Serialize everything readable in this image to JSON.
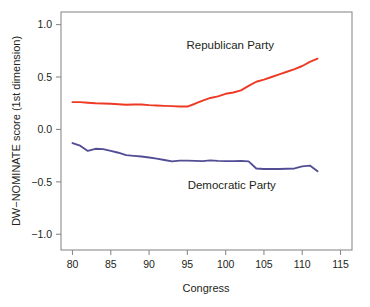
{
  "chart_data": {
    "type": "line",
    "title": "",
    "xlabel": "Congress",
    "ylabel": "DW−NOMINATE score (1st dimension)",
    "xlim": [
      78.5,
      116.5
    ],
    "ylim": [
      -1.15,
      1.12
    ],
    "xticks": [
      80,
      85,
      90,
      95,
      100,
      105,
      110,
      115
    ],
    "xticklabels": [
      "80",
      "85",
      "90",
      "95",
      "100",
      "105",
      "110",
      "115"
    ],
    "yticks": [
      1.0,
      0.5,
      0.0,
      -0.5,
      -1.0
    ],
    "yticklabels": [
      "1.0",
      "0.5",
      "0.0",
      "−0.5",
      "−1.0"
    ],
    "grid": false,
    "legend_position": "inline-annotations",
    "x": [
      80,
      81,
      82,
      83,
      84,
      85,
      86,
      87,
      88,
      89,
      90,
      91,
      92,
      93,
      94,
      95,
      96,
      97,
      98,
      99,
      100,
      101,
      102,
      103,
      104,
      105,
      106,
      107,
      108,
      109,
      110,
      111,
      112
    ],
    "series": [
      {
        "name": "Republican Party",
        "color": "#ee3a24",
        "label_x": 100.6,
        "label_y": 0.77,
        "values": [
          0.26,
          0.26,
          0.255,
          0.25,
          0.248,
          0.245,
          0.24,
          0.235,
          0.238,
          0.238,
          0.232,
          0.228,
          0.225,
          0.222,
          0.218,
          0.218,
          0.245,
          0.275,
          0.3,
          0.315,
          0.34,
          0.352,
          0.372,
          0.415,
          0.455,
          0.475,
          0.5,
          0.525,
          0.55,
          0.575,
          0.605,
          0.645,
          0.675
        ]
      },
      {
        "name": "Democratic Party",
        "color": "#514e96",
        "label_x": 100.8,
        "label_y": -0.565,
        "values": [
          -0.13,
          -0.155,
          -0.205,
          -0.185,
          -0.188,
          -0.205,
          -0.222,
          -0.245,
          -0.252,
          -0.258,
          -0.268,
          -0.278,
          -0.292,
          -0.305,
          -0.298,
          -0.298,
          -0.3,
          -0.302,
          -0.295,
          -0.3,
          -0.302,
          -0.302,
          -0.3,
          -0.305,
          -0.372,
          -0.378,
          -0.378,
          -0.378,
          -0.375,
          -0.372,
          -0.352,
          -0.345,
          -0.398
        ]
      }
    ]
  }
}
